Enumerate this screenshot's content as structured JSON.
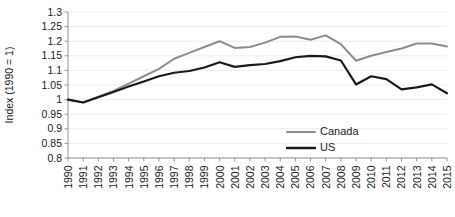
{
  "chart_data": {
    "type": "line",
    "title": "",
    "subtitle": "",
    "xlabel": "",
    "ylabel": "Index (1990 = 1)",
    "grid": "horizontal",
    "legend_position": "inside-lower-right",
    "xlim": [
      1990,
      2015
    ],
    "ylim": [
      0.8,
      1.3
    ],
    "ytick_step": 0.05,
    "x": [
      1990,
      1991,
      1992,
      1993,
      1994,
      1995,
      1996,
      1997,
      1998,
      1999,
      2000,
      2001,
      2002,
      2003,
      2004,
      2005,
      2006,
      2007,
      2008,
      2009,
      2010,
      2011,
      2012,
      2013,
      2014,
      2015
    ],
    "xticklabels": [
      "1990",
      "1991",
      "1992",
      "1993",
      "1994",
      "1995",
      "1996",
      "1997",
      "1998",
      "1999",
      "2000",
      "2001",
      "2002",
      "2003",
      "2004",
      "2005",
      "2006",
      "2007",
      "2008",
      "2009",
      "2010",
      "2011",
      "2012",
      "2013",
      "2014",
      "2015"
    ],
    "yticklabels": [
      "0.8",
      "0.85",
      "0.9",
      "0.95",
      "1",
      "1.05",
      "1.1",
      "1.15",
      "1.2",
      "1.25",
      "1.3"
    ],
    "yticks": [
      0.8,
      0.85,
      0.9,
      0.95,
      1.0,
      1.05,
      1.1,
      1.15,
      1.2,
      1.25,
      1.3
    ],
    "series": [
      {
        "name": "Canada",
        "color": "#8c8c8c",
        "width": 2.0,
        "values": [
          1.0,
          0.99,
          1.01,
          1.03,
          1.055,
          1.08,
          1.105,
          1.14,
          1.16,
          1.18,
          1.2,
          1.177,
          1.18,
          1.195,
          1.215,
          1.216,
          1.205,
          1.22,
          1.19,
          1.133,
          1.15,
          1.163,
          1.175,
          1.192,
          1.192,
          1.182
        ]
      },
      {
        "name": "US",
        "color": "#1a1a1a",
        "width": 2.2,
        "values": [
          1.0,
          0.99,
          1.008,
          1.026,
          1.045,
          1.062,
          1.08,
          1.092,
          1.098,
          1.11,
          1.128,
          1.112,
          1.118,
          1.122,
          1.132,
          1.145,
          1.15,
          1.148,
          1.134,
          1.052,
          1.08,
          1.07,
          1.035,
          1.042,
          1.052,
          1.022
        ]
      }
    ]
  },
  "legend": {
    "items": [
      {
        "label": "Canada",
        "color": "#8c8c8c"
      },
      {
        "label": "US",
        "color": "#1a1a1a"
      }
    ]
  }
}
